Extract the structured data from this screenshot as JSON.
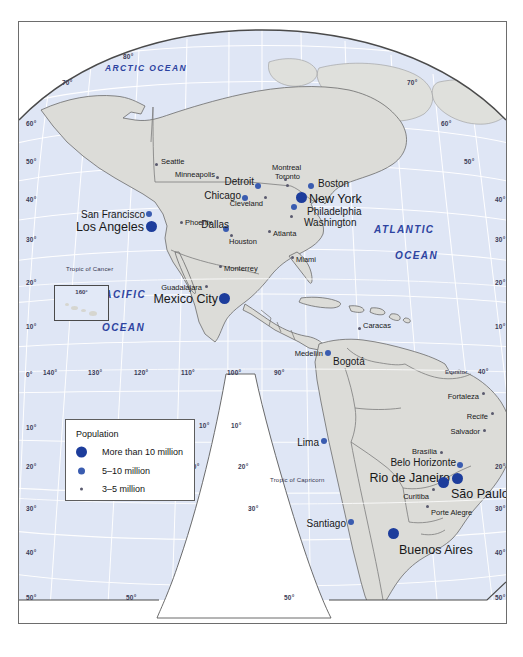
{
  "map": {
    "title": "World map of large cities — Americas",
    "projection_note": "interrupted polyconic",
    "colors": {
      "ocean": "#dfe6f5",
      "land": "#dcdcd8",
      "graticule": "#ffffff",
      "coastline": "#6b6b6b",
      "border": "#5a5a5a",
      "dot_large": "#1d3d9c",
      "dot_medium": "#3a5cb0",
      "dot_small": "#5a5a6e",
      "ocean_label": "#2d43a0",
      "frame": "#6d6d6d",
      "page_background": "#ffffff"
    }
  },
  "legend": {
    "title": "Population",
    "items": [
      {
        "symbol": "large-dot",
        "label": "More than 10 million"
      },
      {
        "symbol": "medium-dot",
        "label": "5–10 million"
      },
      {
        "symbol": "small-dot",
        "label": "3–5 million"
      }
    ]
  },
  "inset": {
    "label": "160°"
  },
  "ocean_labels": [
    {
      "text": "ARCTIC OCEAN",
      "x": 104,
      "y": 63,
      "size": 8.5
    },
    {
      "text": "PACIFIC",
      "x": 96,
      "y": 289,
      "size": 10
    },
    {
      "text": "OCEAN",
      "x": 101,
      "y": 322,
      "size": 10
    },
    {
      "text": "ATLANTIC",
      "x": 373,
      "y": 224,
      "size": 10
    },
    {
      "text": "OCEAN",
      "x": 394,
      "y": 250,
      "size": 10
    }
  ],
  "geo_labels": [
    {
      "text": "Tropic of Cancer",
      "x": 65,
      "y": 265
    },
    {
      "text": "Tropic of Capricorn",
      "x": 269,
      "y": 476
    },
    {
      "text": "Equator",
      "x": 444,
      "y": 368
    }
  ],
  "graticule_labels": [
    {
      "text": "80°",
      "x": 122,
      "y": 53
    },
    {
      "text": "70°",
      "x": 61,
      "y": 79
    },
    {
      "text": "70°",
      "x": 406,
      "y": 79
    },
    {
      "text": "60°",
      "x": 25,
      "y": 120
    },
    {
      "text": "60°",
      "x": 440,
      "y": 120
    },
    {
      "text": "50°",
      "x": 25,
      "y": 158
    },
    {
      "text": "50°",
      "x": 463,
      "y": 158
    },
    {
      "text": "40°",
      "x": 25,
      "y": 196
    },
    {
      "text": "40°",
      "x": 494,
      "y": 196
    },
    {
      "text": "30°",
      "x": 25,
      "y": 236
    },
    {
      "text": "30°",
      "x": 494,
      "y": 236
    },
    {
      "text": "20°",
      "x": 25,
      "y": 279
    },
    {
      "text": "20°",
      "x": 494,
      "y": 279
    },
    {
      "text": "10°",
      "x": 25,
      "y": 323
    },
    {
      "text": "10°",
      "x": 494,
      "y": 323
    },
    {
      "text": "0°",
      "x": 25,
      "y": 371
    },
    {
      "text": "140°",
      "x": 42,
      "y": 369
    },
    {
      "text": "130°",
      "x": 87,
      "y": 369
    },
    {
      "text": "120°",
      "x": 133,
      "y": 369
    },
    {
      "text": "110°",
      "x": 180,
      "y": 369
    },
    {
      "text": "100°",
      "x": 226,
      "y": 369
    },
    {
      "text": "90°",
      "x": 273,
      "y": 369
    },
    {
      "text": "40°",
      "x": 477,
      "y": 368
    },
    {
      "text": "10°",
      "x": 25,
      "y": 424
    },
    {
      "text": "10°",
      "x": 198,
      "y": 422
    },
    {
      "text": "10°",
      "x": 230,
      "y": 422
    },
    {
      "text": "20°",
      "x": 25,
      "y": 463
    },
    {
      "text": "20°",
      "x": 188,
      "y": 463
    },
    {
      "text": "20°",
      "x": 237,
      "y": 463
    },
    {
      "text": "20°",
      "x": 494,
      "y": 463
    },
    {
      "text": "30°",
      "x": 25,
      "y": 505
    },
    {
      "text": "30°",
      "x": 247,
      "y": 505
    },
    {
      "text": "30°",
      "x": 494,
      "y": 505
    },
    {
      "text": "40°",
      "x": 25,
      "y": 549
    },
    {
      "text": "40°",
      "x": 494,
      "y": 549
    },
    {
      "text": "50°",
      "x": 25,
      "y": 594
    },
    {
      "text": "50°",
      "x": 125,
      "y": 594
    },
    {
      "text": "50°",
      "x": 283,
      "y": 594
    },
    {
      "text": "50°",
      "x": 494,
      "y": 594
    }
  ],
  "cities": [
    {
      "name": "Seattle",
      "dot": "small",
      "dx": 155,
      "dy": 163,
      "lx": 160,
      "ly": 157,
      "size": "sz-s",
      "anchor": "left"
    },
    {
      "name": "Minneapolis",
      "dot": "small",
      "dx": 216,
      "dy": 176,
      "lx": 214,
      "ly": 170,
      "size": "sz-s",
      "anchor": "right"
    },
    {
      "name": "Montreal",
      "dot": "small",
      "dx": 284,
      "dy": 178,
      "lx": 271,
      "ly": 163,
      "size": "sz-s",
      "anchor": "left"
    },
    {
      "name": "Toronto",
      "dot": "small",
      "dx": 286,
      "dy": 184,
      "lx": 274,
      "ly": 172,
      "size": "sz-s",
      "anchor": "left"
    },
    {
      "name": "Detroit",
      "dot": "mid",
      "dx": 257,
      "dy": 185,
      "lx": 253,
      "ly": 176,
      "size": "sz-m",
      "anchor": "right"
    },
    {
      "name": "Boston",
      "dot": "mid",
      "dx": 310,
      "dy": 185,
      "lx": 317,
      "ly": 178,
      "size": "sz-m",
      "anchor": "left"
    },
    {
      "name": "Chicago",
      "dot": "mid",
      "dx": 244,
      "dy": 197,
      "lx": 240,
      "ly": 190,
      "size": "sz-m",
      "anchor": "right"
    },
    {
      "name": "Cleveland",
      "dot": "small",
      "dx": 264,
      "dy": 196,
      "lx": 262,
      "ly": 199,
      "size": "sz-s",
      "anchor": "right"
    },
    {
      "name": "New York",
      "dot": "big",
      "dx": 300,
      "dy": 196,
      "lx": 308,
      "ly": 192,
      "size": "sz-l",
      "anchor": "left"
    },
    {
      "name": "Philadelphia",
      "dot": "mid",
      "dx": 293,
      "dy": 206,
      "lx": 306,
      "ly": 206,
      "size": "sz-m",
      "anchor": "left"
    },
    {
      "name": "Washington",
      "dot": "small",
      "dx": 290,
      "dy": 215,
      "lx": 303,
      "ly": 217,
      "size": "sz-m",
      "anchor": "left"
    },
    {
      "name": "San Francisco",
      "dot": "mid",
      "dx": 148,
      "dy": 213,
      "lx": 144,
      "ly": 209,
      "size": "sz-m",
      "anchor": "right"
    },
    {
      "name": "Los Angeles",
      "dot": "big",
      "dx": 150,
      "dy": 225,
      "lx": 143,
      "ly": 220,
      "size": "sz-l",
      "anchor": "right"
    },
    {
      "name": "Phoenix",
      "dot": "small",
      "dx": 180,
      "dy": 221,
      "lx": 184,
      "ly": 218,
      "size": "sz-s",
      "anchor": "left"
    },
    {
      "name": "Dallas",
      "dot": "mid",
      "dx": 225,
      "dy": 228,
      "lx": 228,
      "ly": 219,
      "size": "sz-m",
      "anchor": "right"
    },
    {
      "name": "Atlanta",
      "dot": "small",
      "dx": 268,
      "dy": 230,
      "lx": 272,
      "ly": 229,
      "size": "sz-s",
      "anchor": "left"
    },
    {
      "name": "Houston",
      "dot": "small",
      "dx": 230,
      "dy": 234,
      "lx": 228,
      "ly": 237,
      "size": "sz-s",
      "anchor": "left"
    },
    {
      "name": "Miami",
      "dot": "small",
      "dx": 291,
      "dy": 256,
      "lx": 295,
      "ly": 255,
      "size": "sz-s",
      "anchor": "left"
    },
    {
      "name": "Monterrey",
      "dot": "small",
      "dx": 219,
      "dy": 265,
      "lx": 223,
      "ly": 264,
      "size": "sz-s",
      "anchor": "left"
    },
    {
      "name": "Guadalajara",
      "dot": "small",
      "dx": 205,
      "dy": 285,
      "lx": 201,
      "ly": 283,
      "size": "sz-s",
      "anchor": "right"
    },
    {
      "name": "Mexico City",
      "dot": "big",
      "dx": 223,
      "dy": 297,
      "lx": 217,
      "ly": 292,
      "size": "sz-l",
      "anchor": "right"
    },
    {
      "name": "Caracas",
      "dot": "small",
      "dx": 358,
      "dy": 327,
      "lx": 362,
      "ly": 321,
      "size": "sz-s",
      "anchor": "left"
    },
    {
      "name": "Medellín",
      "dot": "small",
      "dx": 326,
      "dy": 351,
      "lx": 322,
      "ly": 349,
      "size": "sz-s",
      "anchor": "right"
    },
    {
      "name": "Bogotá",
      "dot": "mid",
      "dx": 327,
      "dy": 352,
      "lx": 332,
      "ly": 356,
      "size": "sz-m",
      "anchor": "left"
    },
    {
      "name": "Fortaleza",
      "dot": "small",
      "dx": 482,
      "dy": 392,
      "lx": 478,
      "ly": 392,
      "size": "sz-s",
      "anchor": "right"
    },
    {
      "name": "Recife",
      "dot": "small",
      "dx": 491,
      "dy": 412,
      "lx": 487,
      "ly": 412,
      "size": "sz-s",
      "anchor": "right"
    },
    {
      "name": "Salvador",
      "dot": "small",
      "dx": 483,
      "dy": 429,
      "lx": 479,
      "ly": 427,
      "size": "sz-s",
      "anchor": "right"
    },
    {
      "name": "Lima",
      "dot": "mid",
      "dx": 323,
      "dy": 440,
      "lx": 318,
      "ly": 437,
      "size": "sz-m",
      "anchor": "right"
    },
    {
      "name": "Brasília",
      "dot": "small",
      "dx": 440,
      "dy": 451,
      "lx": 436,
      "ly": 447,
      "size": "sz-s",
      "anchor": "right"
    },
    {
      "name": "Belo Horizonte",
      "dot": "mid",
      "dx": 459,
      "dy": 464,
      "lx": 455,
      "ly": 457,
      "size": "sz-m",
      "anchor": "right"
    },
    {
      "name": "Rio de Janeiro",
      "dot": "big",
      "dx": 456,
      "dy": 477,
      "lx": 449,
      "ly": 471,
      "size": "sz-l",
      "anchor": "right"
    },
    {
      "name": "São Paulo",
      "dot": "big",
      "dx": 442,
      "dy": 481,
      "lx": 450,
      "ly": 487,
      "size": "sz-l",
      "anchor": "left"
    },
    {
      "name": "Curitiba",
      "dot": "small",
      "dx": 432,
      "dy": 488,
      "lx": 428,
      "ly": 492,
      "size": "sz-s",
      "anchor": "right"
    },
    {
      "name": "Porte Alegre",
      "dot": "small",
      "dx": 426,
      "dy": 505,
      "lx": 430,
      "ly": 508,
      "size": "sz-s",
      "anchor": "left"
    },
    {
      "name": "Santiago",
      "dot": "mid",
      "dx": 350,
      "dy": 521,
      "lx": 345,
      "ly": 518,
      "size": "sz-m",
      "anchor": "right"
    },
    {
      "name": "Buenos Aires",
      "dot": "big",
      "dx": 392,
      "dy": 532,
      "lx": 398,
      "ly": 543,
      "size": "sz-l",
      "anchor": "left"
    }
  ]
}
